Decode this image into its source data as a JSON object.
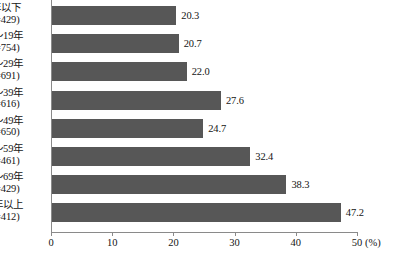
{
  "chart_data": {
    "type": "bar",
    "orientation": "horizontal",
    "title": "",
    "xlabel": "(%)",
    "ylabel": "",
    "xlim": [
      0,
      50
    ],
    "xticks": [
      0,
      10,
      20,
      30,
      40,
      50
    ],
    "xtick_labels": [
      "0",
      "10",
      "20",
      "30",
      "40",
      "50"
    ],
    "unit": "(%)",
    "grid": false,
    "legend": false,
    "bar_color": "#575757",
    "axis_color": "#8a8a8a",
    "categories": [
      "9年以下\n(n=429)",
      "10〜19年\n(n=754)",
      "20〜29年\n(n=691)",
      "30〜39年\n(n=616)",
      "40〜49年\n(n=650)",
      "50〜59年\n(n=461)",
      "60〜69年\n(n=429)",
      "70年以上\n(n=412)"
    ],
    "values": [
      20.3,
      20.7,
      22.0,
      27.6,
      24.7,
      32.4,
      38.3,
      47.2
    ],
    "value_labels": [
      "20.3",
      "20.7",
      "22.0",
      "27.6",
      "24.7",
      "32.4",
      "38.3",
      "47.2"
    ],
    "rows": [
      {
        "label_line1": "9年以下",
        "label_line2": "(n=429)",
        "value": 20.3,
        "value_label": "20.3",
        "n": 429
      },
      {
        "label_line1": "10〜19年",
        "label_line2": "(n=754)",
        "value": 20.7,
        "value_label": "20.7",
        "n": 754
      },
      {
        "label_line1": "20〜29年",
        "label_line2": "(n=691)",
        "value": 22.0,
        "value_label": "22.0",
        "n": 691
      },
      {
        "label_line1": "30〜39年",
        "label_line2": "(n=616)",
        "value": 27.6,
        "value_label": "27.6",
        "n": 616
      },
      {
        "label_line1": "40〜49年",
        "label_line2": "(n=650)",
        "value": 24.7,
        "value_label": "24.7",
        "n": 650
      },
      {
        "label_line1": "50〜59年",
        "label_line2": "(n=461)",
        "value": 32.4,
        "value_label": "32.4",
        "n": 461
      },
      {
        "label_line1": "60〜69年",
        "label_line2": "(n=429)",
        "value": 38.3,
        "value_label": "38.3",
        "n": 429
      },
      {
        "label_line1": "70年以上",
        "label_line2": "(n=412)",
        "value": 47.2,
        "value_label": "47.2",
        "n": 412
      }
    ]
  }
}
